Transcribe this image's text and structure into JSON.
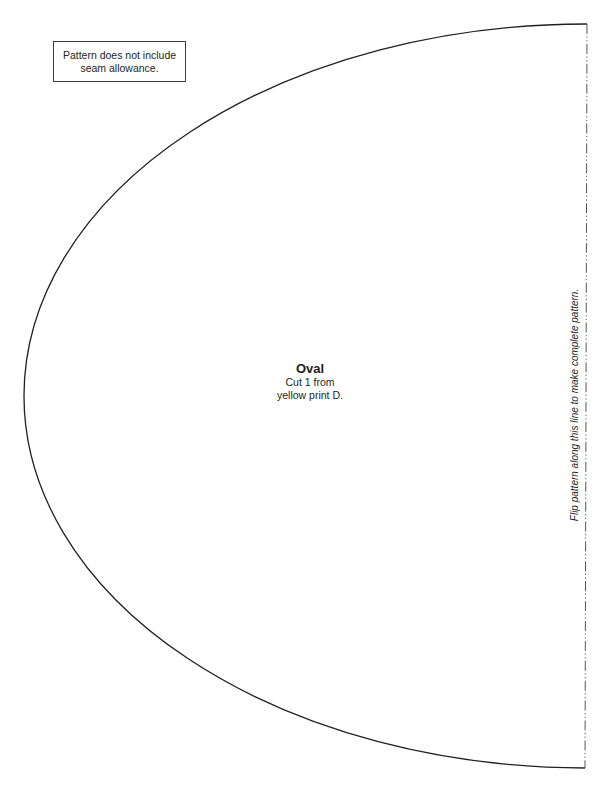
{
  "page": {
    "background": "#ffffff",
    "line_color": "#231f20"
  },
  "note": {
    "line1": "Pattern does not include",
    "line2": "seam allowance."
  },
  "piece": {
    "name": "Oval",
    "instruction_line1": "Cut 1 from",
    "instruction_line2": "yellow print D."
  },
  "fold_line": {
    "text": "Flip pattern along this line to make complete pattern.",
    "style": "dash-dot"
  },
  "shape": {
    "type": "half-ellipse",
    "center_x": 586,
    "center_y": 396,
    "radius_x": 562,
    "radius_y": 372
  }
}
